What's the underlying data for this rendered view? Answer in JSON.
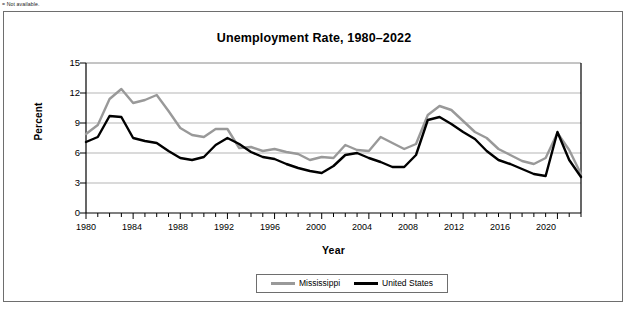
{
  "footnote": "= Not available.",
  "chart": {
    "title": "Unemployment Rate, 1980–2022",
    "xlabel": "Year",
    "ylabel": "Percent",
    "ytick_labels": [
      "15",
      "12",
      "9",
      "6",
      "3",
      "0"
    ],
    "xtick_labels": [
      "1980",
      "1984",
      "1988",
      "1992",
      "1996",
      "2000",
      "2004",
      "2008",
      "2012",
      "2016",
      "2020"
    ],
    "legend": [
      {
        "label": "Mississippi",
        "color": "#999999"
      },
      {
        "label": "United States",
        "color": "#000000"
      }
    ]
  },
  "chart_data": {
    "type": "line",
    "title": "Unemployment Rate, 1980–2022",
    "xlabel": "Year",
    "ylabel": "Percent",
    "xlim": [
      1980,
      2022
    ],
    "ylim": [
      0,
      15
    ],
    "yticks": [
      0,
      3,
      6,
      9,
      12,
      15
    ],
    "xticks": [
      1980,
      1984,
      1988,
      1992,
      1996,
      2000,
      2004,
      2008,
      2012,
      2016,
      2020
    ],
    "grid": "horizontal",
    "legend_position": "bottom-center",
    "x": [
      1980,
      1981,
      1982,
      1983,
      1984,
      1985,
      1986,
      1987,
      1988,
      1989,
      1990,
      1991,
      1992,
      1993,
      1994,
      1995,
      1996,
      1997,
      1998,
      1999,
      2000,
      2001,
      2002,
      2003,
      2004,
      2005,
      2006,
      2007,
      2008,
      2009,
      2010,
      2011,
      2012,
      2013,
      2014,
      2015,
      2016,
      2017,
      2018,
      2019,
      2020,
      2021,
      2022
    ],
    "series": [
      {
        "name": "Mississippi",
        "color": "#999999",
        "values": [
          7.9,
          8.8,
          11.4,
          12.4,
          11.0,
          11.3,
          11.8,
          10.2,
          8.5,
          7.8,
          7.6,
          8.4,
          8.4,
          6.5,
          6.6,
          6.2,
          6.4,
          6.1,
          5.9,
          5.3,
          5.6,
          5.5,
          6.8,
          6.3,
          6.2,
          7.6,
          7.0,
          6.4,
          6.9,
          9.8,
          10.7,
          10.3,
          9.2,
          8.1,
          7.5,
          6.4,
          5.8,
          5.2,
          4.9,
          5.5,
          8.0,
          6.3,
          3.9
        ]
      },
      {
        "name": "United States",
        "color": "#000000",
        "values": [
          7.1,
          7.6,
          9.7,
          9.6,
          7.5,
          7.2,
          7.0,
          6.2,
          5.5,
          5.3,
          5.6,
          6.8,
          7.5,
          6.9,
          6.1,
          5.6,
          5.4,
          4.9,
          4.5,
          4.2,
          4.0,
          4.7,
          5.8,
          6.0,
          5.5,
          5.1,
          4.6,
          4.6,
          5.8,
          9.3,
          9.6,
          8.9,
          8.1,
          7.4,
          6.2,
          5.3,
          4.9,
          4.4,
          3.9,
          3.7,
          8.1,
          5.3,
          3.6
        ]
      }
    ]
  }
}
